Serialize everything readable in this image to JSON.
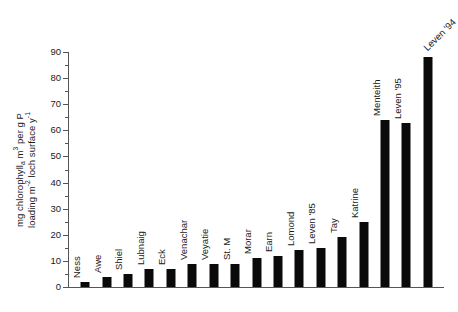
{
  "chart_data": {
    "type": "bar",
    "title": "",
    "subtitle": "",
    "xlabel": "",
    "ylabel_lines": [
      "mg chlorophyll_a m³ per g P",
      "loading m⁻² loch surface y⁻¹"
    ],
    "ylabel_plain": "mg chlorophyll a m3 per g P loading m-2 loch surface y-1",
    "ylim": [
      0,
      90
    ],
    "ytick_step": 10,
    "yminor_step": 5,
    "grid": false,
    "legend": "none",
    "bar_color": "#0a0a0a",
    "axis_color": "#555555",
    "ytick_labels": [
      "0",
      "10",
      "20",
      "30",
      "40",
      "50",
      "60",
      "70",
      "80",
      "90"
    ],
    "ytick_values": [
      0,
      10,
      20,
      30,
      40,
      50,
      60,
      70,
      80,
      90
    ],
    "categories": [
      "Ness",
      "Awe",
      "Shiel",
      "Lubnaig",
      "Eck",
      "Venachar",
      "Veyatie",
      "St. M",
      "Morar",
      "Earn",
      "Lomond",
      "Leven '85",
      "Tay",
      "Katrine",
      "Menteith",
      "Leven '95",
      "Leven '94"
    ],
    "values": [
      2,
      4,
      5,
      7,
      7,
      9,
      9,
      9,
      11,
      12,
      14,
      15,
      19,
      25,
      64,
      63,
      88
    ],
    "label_rotation_deg": 90,
    "last_label_rotation_deg": 45
  }
}
